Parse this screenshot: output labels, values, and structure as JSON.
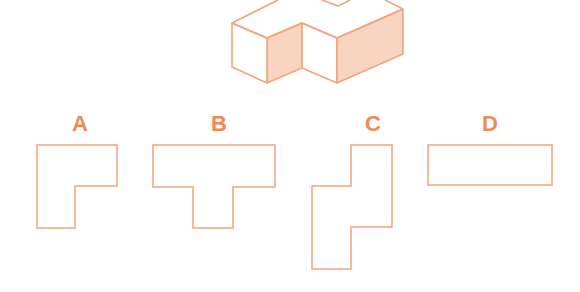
{
  "figure": {
    "colors": {
      "stroke": "#f2a47c",
      "shaded_face": "#f9d4c0",
      "label": "#ef8a55",
      "background": "#ffffff"
    },
    "options": [
      {
        "label": "A",
        "shape": "L-shape"
      },
      {
        "label": "B",
        "shape": "T-shape"
      },
      {
        "label": "C",
        "shape": "offset stepped shape"
      },
      {
        "label": "D",
        "shape": "rectangle"
      }
    ]
  }
}
